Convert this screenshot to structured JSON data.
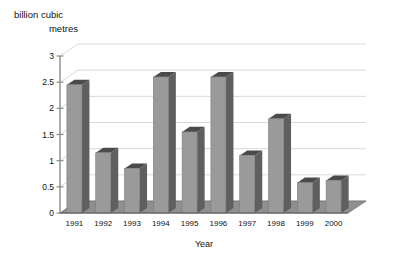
{
  "chart_data": {
    "type": "bar",
    "title": "",
    "ylabel": "billion cubic metres",
    "xlabel": "Year",
    "categories": [
      "1991",
      "1992",
      "1993",
      "1994",
      "1995",
      "1996",
      "1997",
      "1998",
      "1999",
      "2000"
    ],
    "values": [
      2.45,
      1.15,
      0.85,
      2.6,
      1.55,
      2.6,
      1.1,
      1.8,
      0.58,
      0.62
    ],
    "ylim": [
      0,
      3
    ],
    "yticks": [
      0,
      0.5,
      1,
      1.5,
      2,
      2.5,
      3
    ],
    "ytick_labels": [
      "0",
      "0.5",
      "1",
      "1.5",
      "2",
      "2.5",
      "3"
    ],
    "grid": true,
    "legend": false,
    "style": "3d-perspective-bars",
    "colors": {
      "bar_front": "#9a9a9a",
      "bar_side": "#5f5f5f",
      "bar_top": "#4a4a4a",
      "floor": "#8f8f8f",
      "grid": "#d9d9d9",
      "axis": "#8c8c8c",
      "text": "#111111",
      "background": "#ffffff"
    }
  }
}
